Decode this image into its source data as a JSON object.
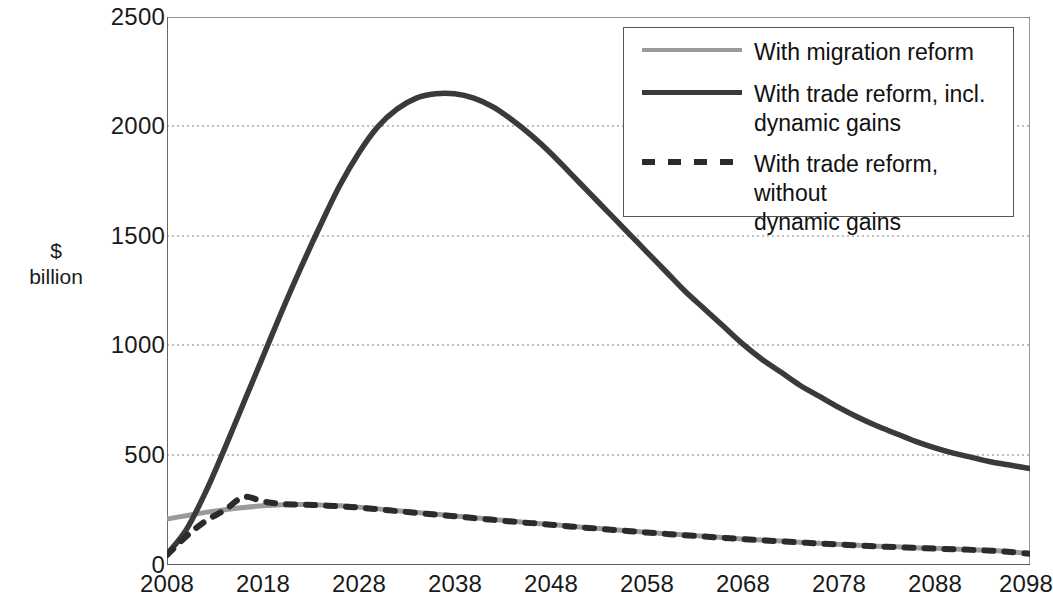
{
  "axes": {
    "ylabel_line1": "$",
    "ylabel_line2": "billion",
    "yticks": [
      "2500",
      "2000",
      "1500",
      "1000",
      "500",
      "0"
    ],
    "xticks": [
      "2008",
      "2018",
      "2028",
      "2038",
      "2048",
      "2058",
      "2068",
      "2078",
      "2088",
      "2098"
    ]
  },
  "legend": {
    "items": [
      {
        "label": "With migration reform",
        "style": "solid-gray",
        "color": "#9a9a9a"
      },
      {
        "label": "With trade reform, incl. dynamic gains",
        "style": "solid-dark",
        "color": "#3a3a3a"
      },
      {
        "label": "With trade reform, without dynamic gains",
        "style": "dashed-dark",
        "color": "#2b2b2b"
      }
    ],
    "item0_label": "With migration reform",
    "item1_label_line1": "With trade reform, incl.",
    "item1_label_line2": "dynamic gains",
    "item2_label_line1": "With trade reform, without",
    "item2_label_line2": "dynamic gains"
  },
  "chart_data": {
    "type": "line",
    "title": "",
    "xlabel": "",
    "ylabel": "$ billion",
    "xlim": [
      2008,
      2098
    ],
    "ylim": [
      0,
      2500
    ],
    "yticks": [
      0,
      500,
      1000,
      1500,
      2000,
      2500
    ],
    "xticks": [
      2008,
      2018,
      2028,
      2038,
      2048,
      2058,
      2068,
      2078,
      2088,
      2098
    ],
    "grid": "horizontal-dotted",
    "legend_position": "top-right",
    "x": [
      2008,
      2010,
      2012,
      2014,
      2016,
      2018,
      2020,
      2022,
      2024,
      2026,
      2028,
      2030,
      2032,
      2034,
      2036,
      2038,
      2040,
      2042,
      2044,
      2046,
      2048,
      2050,
      2052,
      2054,
      2056,
      2058,
      2060,
      2062,
      2064,
      2066,
      2068,
      2070,
      2072,
      2074,
      2076,
      2078,
      2080,
      2082,
      2084,
      2086,
      2088,
      2090,
      2092,
      2094,
      2096,
      2098
    ],
    "series": [
      {
        "name": "With migration reform",
        "color": "#9a9a9a",
        "style": "solid",
        "values": [
          210,
          225,
          240,
          252,
          262,
          270,
          275,
          276,
          274,
          270,
          264,
          256,
          248,
          240,
          232,
          224,
          216,
          208,
          200,
          192,
          185,
          177,
          170,
          163,
          156,
          149,
          143,
          137,
          131,
          125,
          119,
          114,
          109,
          104,
          99,
          95,
          90,
          86,
          83,
          79,
          76,
          73,
          70,
          66,
          60,
          52
        ]
      },
      {
        "name": "With trade reform, incl. dynamic gains",
        "color": "#3a3a3a",
        "style": "solid",
        "values": [
          50,
          160,
          330,
          530,
          740,
          950,
          1160,
          1360,
          1550,
          1730,
          1880,
          2000,
          2080,
          2130,
          2150,
          2150,
          2130,
          2090,
          2030,
          1960,
          1880,
          1790,
          1700,
          1610,
          1520,
          1430,
          1340,
          1250,
          1170,
          1090,
          1010,
          940,
          880,
          820,
          770,
          720,
          675,
          635,
          600,
          565,
          535,
          510,
          490,
          470,
          455,
          440
        ]
      },
      {
        "name": "With trade reform, without dynamic gains",
        "color": "#2b2b2b",
        "style": "dashed",
        "values": [
          45,
          130,
          200,
          250,
          310,
          290,
          278,
          276,
          272,
          268,
          262,
          254,
          246,
          238,
          230,
          222,
          214,
          206,
          198,
          191,
          184,
          176,
          169,
          162,
          155,
          148,
          142,
          136,
          130,
          124,
          118,
          113,
          108,
          103,
          98,
          94,
          89,
          85,
          82,
          78,
          75,
          72,
          69,
          65,
          59,
          51
        ]
      }
    ]
  }
}
